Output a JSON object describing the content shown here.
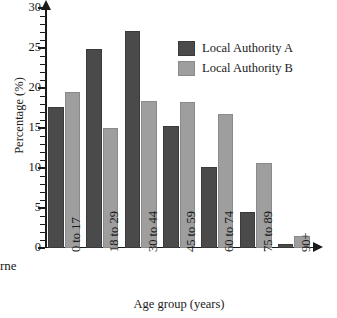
{
  "chart_data": {
    "type": "bar",
    "title": "",
    "xlabel": "Age group (years)",
    "ylabel": "Percentage (%)",
    "categories": [
      "0 to 17",
      "18 to 29",
      "30 to 44",
      "45 to 59",
      "60 to 74",
      "75 to 89",
      "90+"
    ],
    "series": [
      {
        "name": "Local Authority A",
        "color": "#4a4a4a",
        "values": [
          17.6,
          24.9,
          27.1,
          15.2,
          10.1,
          4.5,
          0.5
        ]
      },
      {
        "name": "Local Authority B",
        "color": "#9e9e9e",
        "values": [
          19.5,
          15.0,
          18.4,
          18.3,
          16.7,
          10.6,
          1.5
        ]
      }
    ],
    "ylim": [
      0,
      30
    ],
    "yticks": [
      0,
      5,
      10,
      15,
      20,
      25,
      30
    ],
    "ytick_labels": [
      "0",
      "5",
      "10",
      "15",
      "20",
      "25",
      "30"
    ],
    "yminor_step": 1,
    "grid": false,
    "legend_position": "upper right",
    "axis_arrows": true
  },
  "edge_fragment": "rne"
}
